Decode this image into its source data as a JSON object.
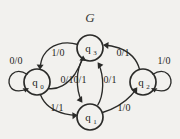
{
  "figure": {
    "title": "G",
    "background_color": "#f2f1ee",
    "stroke_color": "#2b2b29",
    "text_color": "#262624"
  },
  "states": [
    {
      "id": "q0",
      "label": "q",
      "sub": "0",
      "cx": 37,
      "cy": 82,
      "r": 13
    },
    {
      "id": "q3",
      "label": "q",
      "sub": "3",
      "cx": 90,
      "cy": 48,
      "r": 13
    },
    {
      "id": "q2",
      "label": "q",
      "sub": "2",
      "cx": 143,
      "cy": 82,
      "r": 13
    },
    {
      "id": "q1",
      "label": "q",
      "sub": "1",
      "cx": 90,
      "cy": 117,
      "r": 13
    }
  ],
  "transitions": [
    {
      "id": "t-q0-q0",
      "from": "q0",
      "to": "q0",
      "label": "0/0",
      "lx": 16,
      "ly": 64,
      "kind": "self-loop-left"
    },
    {
      "id": "t-q2-q2",
      "from": "q2",
      "to": "q2",
      "label": "1/0",
      "lx": 164,
      "ly": 64,
      "kind": "self-loop-right"
    },
    {
      "id": "t-q3-q0",
      "from": "q3",
      "to": "q0",
      "label": "1/0",
      "lx": 58,
      "ly": 56,
      "kind": "curve"
    },
    {
      "id": "t-q0-q3",
      "from": "q0",
      "to": "q3",
      "label": "0/1",
      "lx": 67,
      "ly": 82,
      "kind": "curve"
    },
    {
      "id": "t-q3-q1",
      "from": "q3",
      "to": "q1",
      "label": "0/1",
      "lx": 80,
      "ly": 82,
      "kind": "curve"
    },
    {
      "id": "t-q1-q3",
      "from": "q1",
      "to": "q3",
      "label": "0/1",
      "lx": 110,
      "ly": 82,
      "kind": "curve"
    },
    {
      "id": "t-q0-q1",
      "from": "q0",
      "to": "q1",
      "label": "1/1",
      "lx": 57,
      "ly": 111,
      "kind": "curve"
    },
    {
      "id": "t-q1-q2",
      "from": "q1",
      "to": "q2",
      "label": "1/0",
      "lx": 124,
      "ly": 111,
      "kind": "curve"
    },
    {
      "id": "t-q2-q3",
      "from": "q2",
      "to": "q3",
      "label": "0/1",
      "lx": 123,
      "ly": 56,
      "kind": "curve"
    }
  ]
}
